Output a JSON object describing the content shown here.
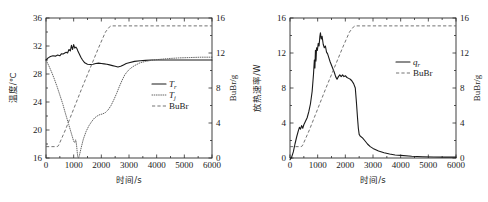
{
  "figure": {
    "panels": [
      "left",
      "right"
    ],
    "shared_xlabel": "时间/s"
  },
  "chart_data": [
    {
      "id": "left",
      "type": "line",
      "title": "",
      "xlabel": "时间/s",
      "ylabel": "温度/℃",
      "y2label": "BuBr/g",
      "xlim": [
        0,
        6000
      ],
      "ylim": [
        16,
        36
      ],
      "y2lim": [
        0,
        16
      ],
      "xticks": [
        0,
        1000,
        2000,
        3000,
        4000,
        5000,
        6000
      ],
      "xticklabels": [
        "0",
        "1000",
        "2000",
        "3000",
        "4000",
        "5000",
        "6000"
      ],
      "yticks": [
        16,
        20,
        24,
        28,
        32,
        36
      ],
      "yticklabels": [
        "16",
        "20",
        "24",
        "28",
        "32",
        "36"
      ],
      "y2ticks": [
        0,
        4,
        8,
        12,
        16
      ],
      "y2ticklabels": [
        "0",
        "4",
        "8",
        "12",
        "16"
      ],
      "grid": false,
      "legend_position": "right-middle",
      "legend": [
        {
          "label": "T",
          "sub": "r",
          "style": "solid"
        },
        {
          "label": "T",
          "sub": "j",
          "style": "dotted"
        },
        {
          "label": "BuBr",
          "sub": "",
          "style": "dashed"
        }
      ],
      "series": [
        {
          "name": "T_r",
          "axis": "left",
          "style": "solid",
          "x": [
            0,
            80,
            160,
            250,
            340,
            420,
            500,
            560,
            620,
            680,
            730,
            780,
            830,
            880,
            920,
            960,
            1000,
            1040,
            1080,
            1120,
            1160,
            1200,
            1260,
            1320,
            1400,
            1500,
            1600,
            1700,
            1800,
            1900,
            2000,
            2100,
            2200,
            2300,
            2400,
            2500,
            2600,
            2700,
            2800,
            2900,
            3000,
            3200,
            3400,
            3600,
            3800,
            4000,
            4400,
            4800,
            5200,
            5600,
            6000
          ],
          "y": [
            30.0,
            30.3,
            30.5,
            30.6,
            30.55,
            30.7,
            30.6,
            30.9,
            30.85,
            31.0,
            31.1,
            31.0,
            31.5,
            31.3,
            32.1,
            31.5,
            32.2,
            31.7,
            31.85,
            31.6,
            31.2,
            30.9,
            30.4,
            30.0,
            29.6,
            29.4,
            29.35,
            29.4,
            29.5,
            29.55,
            29.5,
            29.45,
            29.4,
            29.3,
            29.2,
            29.1,
            29.0,
            29.1,
            29.3,
            29.5,
            29.6,
            29.8,
            29.9,
            29.95,
            30.0,
            30.0,
            30.0,
            30.0,
            30.0,
            30.0,
            30.0
          ]
        },
        {
          "name": "T_j",
          "axis": "left",
          "style": "dotted",
          "x": [
            0,
            100,
            200,
            300,
            400,
            500,
            600,
            700,
            760,
            820,
            880,
            940,
            1000,
            1040,
            1070,
            1090,
            1110,
            1130,
            1150,
            1180,
            1220,
            1280,
            1350,
            1450,
            1550,
            1650,
            1750,
            1850,
            1950,
            2050,
            2150,
            2250,
            2350,
            2450,
            2550,
            2650,
            2750,
            2850,
            2950,
            3050,
            3200,
            3400,
            3600,
            3800,
            4000,
            4400,
            4800,
            5200,
            5600,
            6000
          ],
          "y": [
            30.0,
            29.2,
            28.3,
            27.3,
            26.2,
            25.0,
            23.8,
            22.4,
            21.6,
            20.8,
            20.0,
            19.2,
            18.4,
            18.2,
            18.6,
            18.3,
            17.6,
            16.8,
            16.1,
            16.0,
            16.6,
            17.6,
            18.7,
            19.8,
            20.6,
            21.2,
            21.7,
            22.0,
            22.2,
            22.3,
            22.5,
            22.9,
            23.5,
            24.3,
            25.2,
            26.2,
            27.1,
            27.9,
            28.4,
            28.8,
            29.2,
            29.6,
            29.8,
            29.95,
            30.05,
            30.2,
            30.3,
            30.35,
            30.4,
            30.4
          ]
        },
        {
          "name": "BuBr",
          "axis": "right",
          "style": "dashed",
          "x": [
            0,
            200,
            400,
            450,
            700,
            1000,
            1300,
            1600,
            1900,
            2150,
            2300,
            2350,
            2500,
            3000,
            3500,
            4000,
            4500,
            5000,
            5500,
            6000
          ],
          "y": [
            1.3,
            1.3,
            1.3,
            1.4,
            3.2,
            5.6,
            8.0,
            10.3,
            12.6,
            14.4,
            15.0,
            15.1,
            15.1,
            15.1,
            15.1,
            15.1,
            15.1,
            15.1,
            15.1,
            15.1
          ]
        }
      ]
    },
    {
      "id": "right",
      "type": "line",
      "title": "",
      "xlabel": "时间/s",
      "ylabel": "放热速率/W",
      "y2label": "BuBr/g",
      "xlim": [
        0,
        6000
      ],
      "ylim": [
        0,
        16
      ],
      "y2lim": [
        0,
        16
      ],
      "xticks": [
        0,
        1000,
        2000,
        3000,
        4000,
        5000,
        6000
      ],
      "xticklabels": [
        "0",
        "1000",
        "2000",
        "3000",
        "4000",
        "5000",
        "6000"
      ],
      "yticks": [
        0,
        4,
        8,
        12,
        16
      ],
      "yticklabels": [
        "0",
        "4",
        "8",
        "12",
        "16"
      ],
      "y2ticks": [
        0,
        4,
        8,
        12,
        16
      ],
      "y2ticklabels": [
        "0",
        "4",
        "8",
        "12",
        "16"
      ],
      "grid": false,
      "legend_position": "right-upper",
      "legend": [
        {
          "label": "q",
          "sub": "r",
          "style": "solid"
        },
        {
          "label": "BuBr",
          "sub": "",
          "style": "dashed"
        }
      ],
      "series": [
        {
          "name": "q_r",
          "axis": "left",
          "style": "solid",
          "x": [
            0,
            60,
            120,
            180,
            240,
            300,
            340,
            380,
            420,
            460,
            500,
            560,
            620,
            680,
            740,
            800,
            850,
            880,
            900,
            920,
            940,
            960,
            990,
            1020,
            1050,
            1080,
            1100,
            1130,
            1160,
            1200,
            1240,
            1280,
            1320,
            1360,
            1400,
            1450,
            1500,
            1550,
            1600,
            1650,
            1700,
            1750,
            1800,
            1850,
            1900,
            1950,
            2000,
            2060,
            2120,
            2180,
            2240,
            2300,
            2360,
            2400,
            2440,
            2470,
            2500,
            2540,
            2580,
            2620,
            2700,
            2800,
            2900,
            3000,
            3200,
            3400,
            3600,
            3800,
            4000,
            4400,
            4800,
            5200,
            5600,
            6000
          ],
          "y": [
            -0.2,
            0.1,
            0.7,
            1.6,
            2.4,
            3.1,
            3.5,
            3.3,
            3.7,
            3.4,
            3.8,
            4.2,
            4.6,
            5.3,
            6.2,
            7.6,
            9.6,
            11.2,
            10.3,
            12.3,
            11.1,
            12.6,
            12.3,
            13.1,
            12.8,
            13.9,
            14.3,
            13.6,
            13.9,
            13.0,
            12.6,
            12.8,
            12.1,
            11.9,
            11.5,
            11.0,
            10.6,
            10.2,
            9.8,
            9.3,
            9.0,
            9.3,
            9.5,
            9.3,
            9.5,
            9.3,
            9.4,
            9.2,
            9.1,
            9.0,
            8.8,
            8.5,
            8.0,
            6.4,
            4.6,
            3.4,
            2.7,
            2.5,
            2.4,
            2.3,
            2.0,
            1.6,
            1.3,
            1.1,
            0.8,
            0.6,
            0.45,
            0.35,
            0.3,
            0.2,
            0.15,
            0.12,
            0.1,
            0.1
          ]
        },
        {
          "name": "BuBr",
          "axis": "right",
          "style": "dashed",
          "x": [
            0,
            200,
            400,
            450,
            700,
            1000,
            1300,
            1600,
            1900,
            2150,
            2300,
            2350,
            2500,
            3000,
            3500,
            4000,
            4500,
            5000,
            5500,
            6000
          ],
          "y": [
            1.3,
            1.3,
            1.3,
            1.4,
            3.2,
            5.6,
            8.0,
            10.3,
            12.6,
            14.4,
            15.0,
            15.1,
            15.1,
            15.1,
            15.1,
            15.1,
            15.1,
            15.1,
            15.1,
            15.1
          ]
        }
      ]
    }
  ]
}
